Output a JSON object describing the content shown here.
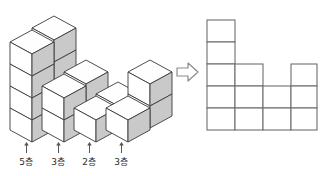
{
  "figure": {
    "title_fragment": "",
    "arrow_glyph": "⇨",
    "arrow_direction": "right",
    "colors": {
      "outline": "#3a3a3a",
      "grid_outline": "#6e6e6e",
      "cube_top_face": "#fefefe",
      "cube_front_face": "#ffffff",
      "cube_side_face": "#c9c9c9",
      "background": "#ffffff",
      "label_text": "#2b2b2b"
    }
  },
  "cube_stack": {
    "name": "isometric-cube-stack",
    "description": "stack of unit cubes viewed isometrically",
    "column_heights": [
      5,
      3,
      2,
      3
    ],
    "depth_rows": 2
  },
  "labels": [
    {
      "tick": "↑",
      "text": "5층",
      "value": 5
    },
    {
      "tick": "↑",
      "text": "3층",
      "value": 3
    },
    {
      "tick": "↑",
      "text": "2층",
      "value": 2
    },
    {
      "tick": "↑",
      "text": "3층",
      "value": 3
    }
  ],
  "grid_figure": {
    "name": "front-view-grid",
    "columns": 4,
    "rows": 5,
    "column_heights": [
      5,
      3,
      2,
      3
    ],
    "cell_width": 28,
    "cell_height": 22
  }
}
